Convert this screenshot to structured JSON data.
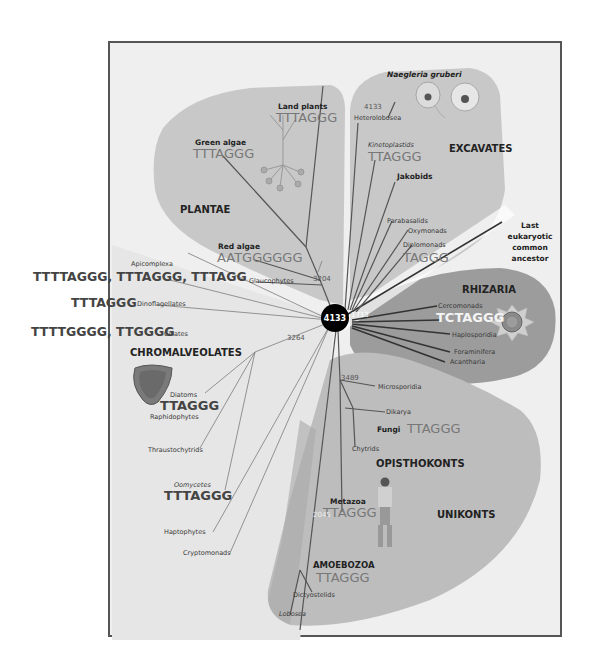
{
  "center_node": {
    "label": "4133"
  },
  "root_label": {
    "lines": [
      "Last",
      "eukaryotic",
      "common",
      "ancestor"
    ]
  },
  "colors": {
    "plantae_bg": "#c9c9c9",
    "excavates_bg": "#c9c9c9",
    "rhizaria_bg": "#9a9a9a",
    "unikonts_bg": "#bdbdbd",
    "chromalveolates_bg": "#e4e4e4",
    "center_node": "#000000"
  },
  "clades": {
    "plantae": {
      "name": "PLANTAE",
      "groups": [
        {
          "name": "Land plants",
          "sequence": "TTTAGGG"
        },
        {
          "name": "Green algae",
          "sequence": "TTTAGGG"
        },
        {
          "name": "Red algae",
          "sequence": "AATGGGGGG"
        },
        {
          "name": "Glaucophytes"
        }
      ],
      "node_number": "3204"
    },
    "excavates": {
      "name": "EXCAVATES",
      "species_label": "Naegleria gruberi",
      "species_number": "4133",
      "groups": [
        {
          "name": "Heterolobosea"
        },
        {
          "name": "Kinetoplastids",
          "sequence": "TTAGGG"
        },
        {
          "name": "Jakobids"
        },
        {
          "name": "Parabasalids"
        },
        {
          "name": "Oxymonads"
        },
        {
          "name": "Diplomonads",
          "sequence": "TAGGG"
        }
      ],
      "node_number": "1713"
    },
    "rhizaria": {
      "name": "RHIZARIA",
      "groups": [
        {
          "name": "Cercomonads",
          "sequence": "TCTAGGG"
        },
        {
          "name": "Haplosporidia"
        },
        {
          "name": "Foraminifera"
        },
        {
          "name": "Acantharia"
        }
      ]
    },
    "chromalveolates": {
      "name": "CHROMALVEOLATES",
      "node_number": "3264",
      "groups": [
        {
          "name": "Apicomplexa",
          "sequence": "TTTTAGGG, TTTAGGG, TTTAGG"
        },
        {
          "name": "Dinoflagellates",
          "sequence": "TTTAGGG"
        },
        {
          "name": "Ciliates",
          "sequence": "TTTTGGGG, TTGGGG"
        },
        {
          "name": "Diatoms",
          "sequence": "TTAGGG"
        },
        {
          "name": "Raphidophytes"
        },
        {
          "name": "Thraustochytrids"
        },
        {
          "name": "Oomycetes",
          "sequence": "TTTAGGG"
        },
        {
          "name": "Haptophytes"
        },
        {
          "name": "Cryptomonads"
        }
      ]
    },
    "opisthokonts": {
      "name": "OPISTHOKONTS",
      "node_number": "3489",
      "groups": [
        {
          "name": "Microsporidia"
        },
        {
          "name": "Dikarya"
        },
        {
          "name": "Fungi",
          "sequence": "TTAGGG"
        },
        {
          "name": "Chytrids"
        },
        {
          "name": "Metazoa",
          "sequence": "TTAGGG"
        }
      ],
      "metazoa_node_number": "2045"
    },
    "unikonts": {
      "name": "UNIKONTS"
    },
    "amoebozoa": {
      "name": "AMOEBOZOA",
      "sequence": "TTAGGG",
      "groups": [
        {
          "name": "Dictyostelids"
        },
        {
          "name": "Lobosea"
        }
      ]
    }
  }
}
